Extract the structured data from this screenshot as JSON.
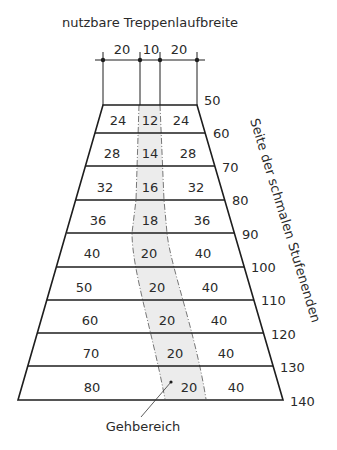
{
  "title": "nutzbare Treppenlaufbreite",
  "dimensions": {
    "left": "20",
    "center": "10",
    "right": "20"
  },
  "side_axis_label": "Seite der schmalen Stufenenden",
  "walk_zone_label": "Gehbereich",
  "side_values": [
    "50",
    "60",
    "70",
    "80",
    "90",
    "100",
    "110",
    "120",
    "130",
    "140"
  ],
  "rows": [
    {
      "left": "24",
      "center": "12",
      "right": "24"
    },
    {
      "left": "28",
      "center": "14",
      "right": "28"
    },
    {
      "left": "32",
      "center": "16",
      "right": "32"
    },
    {
      "left": "36",
      "center": "18",
      "right": "36"
    },
    {
      "left": "40",
      "center": "20",
      "right": "40"
    },
    {
      "left": "50",
      "center": "20",
      "right": "40"
    },
    {
      "left": "60",
      "center": "20",
      "right": "40"
    },
    {
      "left": "70",
      "center": "20",
      "right": "40"
    },
    {
      "left": "80",
      "center": "20",
      "right": "40"
    }
  ],
  "colors": {
    "line": "#1e1e1e",
    "text": "#2a2a2a",
    "walk_zone_fill": "#ececec"
  }
}
